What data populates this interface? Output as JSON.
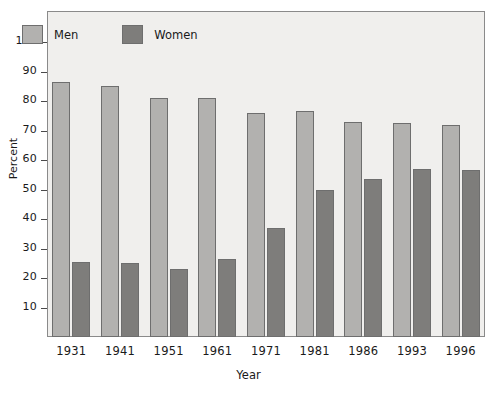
{
  "chart_data": {
    "type": "bar",
    "title": "",
    "xlabel": "Year",
    "ylabel": "Percent",
    "categories": [
      "1931",
      "1941",
      "1951",
      "1961",
      "1971",
      "1981",
      "1986",
      "1993",
      "1996"
    ],
    "series": [
      {
        "name": "Men",
        "color": "#b2b1af",
        "values": [
          86.5,
          85,
          81,
          81,
          76,
          76.5,
          73,
          72.5,
          72
        ]
      },
      {
        "name": "Women",
        "color": "#7e7d7b",
        "values": [
          25.5,
          25,
          23,
          26.5,
          37,
          50,
          53.5,
          57,
          56.5
        ]
      }
    ],
    "ylim": [
      0,
      105
    ],
    "yticks": [
      10,
      20,
      30,
      40,
      50,
      60,
      70,
      80,
      90,
      100
    ],
    "grid": false,
    "legend_position": "top-left"
  },
  "legend": {
    "entries": [
      {
        "label": "Men"
      },
      {
        "label": "Women"
      }
    ]
  },
  "top_caption": ""
}
